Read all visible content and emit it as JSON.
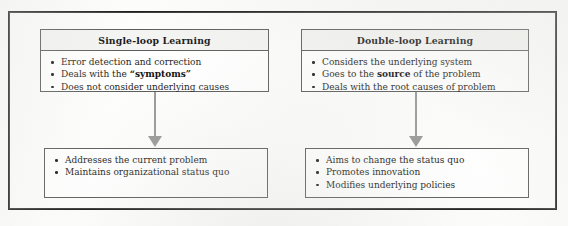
{
  "figure": {
    "frame_color": "#1d1d1d",
    "background_color": "#fdfdfc",
    "arrow_color": "#9a9a9a"
  },
  "columns": [
    {
      "id": "single-loop",
      "header": {
        "title": "Single-loop Learning"
      },
      "characteristics": [
        {
          "text_before": "Error detection and correction",
          "emphasis": "",
          "text_after": ""
        },
        {
          "text_before": "Deals with the ",
          "emphasis": "“symptoms”",
          "text_after": ""
        },
        {
          "text_before": "Does not consider underlying causes",
          "emphasis": "",
          "text_after": ""
        }
      ],
      "connector": {
        "icon": "down-arrow-icon"
      },
      "outcomes": [
        {
          "text_before": "Addresses the current problem",
          "emphasis": "",
          "text_after": ""
        },
        {
          "text_before": "Maintains organizational status quo",
          "emphasis": "",
          "text_after": ""
        }
      ]
    },
    {
      "id": "double-loop",
      "header": {
        "title": "Double-loop Learning"
      },
      "characteristics": [
        {
          "text_before": "Considers the underlying system",
          "emphasis": "",
          "text_after": ""
        },
        {
          "text_before": "Goes to the ",
          "emphasis": "source",
          "text_after": " of the problem"
        },
        {
          "text_before": "Deals with the root causes of problem",
          "emphasis": "",
          "text_after": ""
        }
      ],
      "connector": {
        "icon": "down-arrow-icon"
      },
      "outcomes": [
        {
          "text_before": "Aims to change the status quo",
          "emphasis": "",
          "text_after": ""
        },
        {
          "text_before": "Promotes innovation",
          "emphasis": "",
          "text_after": ""
        },
        {
          "text_before": "Modifies underlying policies",
          "emphasis": "",
          "text_after": ""
        }
      ]
    }
  ]
}
